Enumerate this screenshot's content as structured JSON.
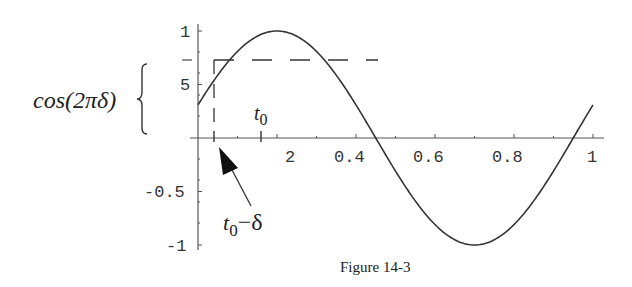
{
  "chart_data": {
    "type": "line",
    "title": "",
    "caption": "Figure 14-3",
    "xlabel": "",
    "ylabel": "",
    "function": "cos(2*pi*(x - 0.2))",
    "xlim": [
      0,
      1
    ],
    "ylim": [
      -1,
      1
    ],
    "grid": false,
    "x_tick_labels": [
      "2",
      "0.4",
      "0.6",
      "0.8",
      "1"
    ],
    "x_tick_values": [
      0.2,
      0.4,
      0.6,
      0.8,
      1.0
    ],
    "y_tick_labels": [
      "1",
      "5",
      "-0.5",
      "-1"
    ],
    "y_tick_values": [
      1.0,
      0.5,
      -0.5,
      -1.0
    ],
    "series": [
      {
        "name": "cos curve",
        "x": [
          0,
          0.05,
          0.1,
          0.15,
          0.2,
          0.25,
          0.3,
          0.35,
          0.4,
          0.45,
          0.5,
          0.55,
          0.6,
          0.65,
          0.7,
          0.75,
          0.8,
          0.85,
          0.9,
          0.95,
          1.0
        ],
        "y": [
          0.31,
          0.59,
          0.81,
          0.95,
          1.0,
          0.95,
          0.81,
          0.59,
          0.31,
          0.0,
          -0.31,
          -0.59,
          -0.81,
          -0.95,
          -1.0,
          -0.95,
          -0.81,
          -0.59,
          -0.31,
          0.0,
          0.31
        ]
      }
    ],
    "annotations": [
      {
        "text_main": "t",
        "text_sub": "0",
        "x": 0.16,
        "note": "tick mark t0 on x-axis"
      },
      {
        "text_main": "t",
        "text_sub": "0",
        "suffix": " − δ",
        "x": 0.04,
        "note": "arrow pointing to tick at t0 − δ"
      },
      {
        "text": "cos(2πδ)",
        "note": "brace marking height of dashed horizontal line",
        "y": 0.73
      }
    ],
    "dashed_lines": [
      {
        "orientation": "horizontal",
        "y": 0.73,
        "x_from": 0.04,
        "x_to": 0.45
      },
      {
        "orientation": "vertical",
        "x": 0.04,
        "y_from": 0,
        "y_to": 0.73
      }
    ]
  },
  "labels": {
    "cos_label": "cos(2πδ)",
    "t0_main": "t",
    "t0_sub": "0",
    "t0d_main": "t",
    "t0d_sub": "0",
    "t0d_suffix": "−δ",
    "caption": "Figure 14-3",
    "xt_02": "2",
    "xt_04": "0.4",
    "xt_06": "0.6",
    "xt_08": "0.8",
    "xt_10": "1",
    "yt_1": "1",
    "yt_05": "5",
    "yt_m05": "-0.5",
    "yt_m1": "-1"
  }
}
